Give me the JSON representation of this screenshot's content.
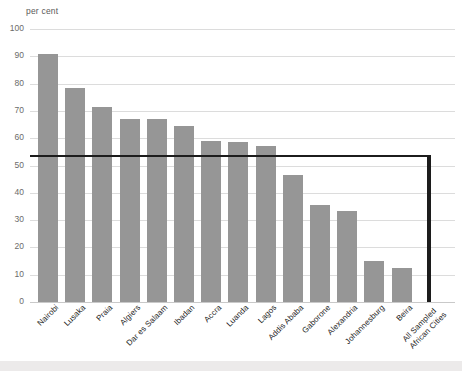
{
  "axis": {
    "unit_label": "per cent",
    "y_ticks": [
      "100",
      "90",
      "80",
      "70",
      "60",
      "50",
      "40",
      "30",
      "20",
      "10",
      "0"
    ]
  },
  "chart_data": {
    "type": "bar",
    "title": "",
    "subtitle": "",
    "xlabel": "",
    "ylabel": "per cent",
    "ylim": [
      0,
      100
    ],
    "grid": true,
    "legend": "none",
    "categories": [
      "Nairobi",
      "Lusaka",
      "Praia",
      "Algiers",
      "Dar es Salaam",
      "Ibadan",
      "Accra",
      "Luanda",
      "Lagos",
      "Addis Ababa",
      "Gaborone",
      "Alexandria",
      "Johannesburg",
      "Beira",
      "All Sampled African Cities"
    ],
    "values": [
      91,
      78.5,
      71.5,
      67,
      67,
      64.5,
      59,
      58.5,
      57,
      46.5,
      35.5,
      33.5,
      15,
      12.5,
      54
    ],
    "bar_colors": [
      "#969696",
      "#969696",
      "#969696",
      "#969696",
      "#969696",
      "#969696",
      "#969696",
      "#969696",
      "#969696",
      "#969696",
      "#969696",
      "#969696",
      "#969696",
      "#969696",
      "#1c1c1c"
    ],
    "reference_line": {
      "value": 54,
      "color": "#1c1c1c",
      "label": ""
    },
    "category_label_lines": [
      [
        "Nairobi"
      ],
      [
        "Lusaka"
      ],
      [
        "Praia"
      ],
      [
        "Algiers"
      ],
      [
        "Dar es Salaam"
      ],
      [
        "Ibadan"
      ],
      [
        "Accra"
      ],
      [
        "Luanda"
      ],
      [
        "Lagos"
      ],
      [
        "Addis Ababa"
      ],
      [
        "Gaborone"
      ],
      [
        "Alexandria"
      ],
      [
        "Johannesburg"
      ],
      [
        "Beira"
      ],
      [
        "All Sampled",
        "African Cities"
      ]
    ]
  }
}
